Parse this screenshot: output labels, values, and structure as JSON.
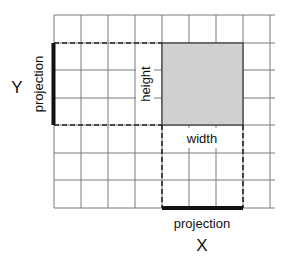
{
  "diagram": {
    "axis_labels": {
      "x": "X",
      "y": "Y"
    },
    "labels": {
      "height": "height",
      "width": "width",
      "y_projection": "projection",
      "x_projection": "projection"
    },
    "grid": {
      "columns": 8,
      "rows": 7,
      "cell_size": 27.2,
      "origin_x": 54,
      "origin_y": 15
    },
    "rectangle": {
      "col_start": 4,
      "col_end": 7,
      "row_start": 1,
      "row_end": 4,
      "fill": "#d0d0d0"
    },
    "colors": {
      "grid": "#7a7a7a",
      "rect_fill": "#d0d0d0",
      "projection": "#111111"
    }
  }
}
